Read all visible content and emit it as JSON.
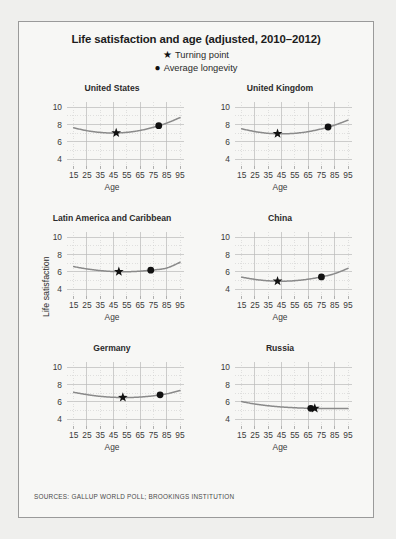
{
  "figure": {
    "title": "Life satisfaction and age (adjusted, 2010–2012)",
    "source": "SOURCES: GALLUP WORLD POLL; BROOKINGS INSTITUTION",
    "ylabel": "Life satisfaction",
    "xlabel": "Age",
    "legend": [
      {
        "marker": "★",
        "label": "Turning point",
        "name": "turning-point"
      },
      {
        "marker": "●",
        "label": "Average longevity",
        "name": "average-longevity"
      }
    ],
    "line_color": "#8a8a8a",
    "marker_color": "#111111",
    "grid_major_color": "#b9b9b9",
    "grid_minor_color": "#cfcfcf",
    "axis_color": "#8e8e8e",
    "panel_bg": "#f7f7f5",
    "border_color": "#9a9a9a"
  },
  "chart_data": {
    "type": "line",
    "title": "Life satisfaction and age (adjusted, 2010–2012)",
    "xlabel": "Age",
    "ylabel": "Life satisfaction",
    "xlim": [
      10,
      98
    ],
    "ylim": [
      3.2,
      10.6
    ],
    "xticks": [
      15,
      25,
      35,
      45,
      55,
      65,
      75,
      85,
      95
    ],
    "yticks": [
      4,
      6,
      8,
      10
    ],
    "yticks_minor": [
      5,
      7,
      9
    ],
    "grid": true,
    "legend_position": "top-center",
    "panels": [
      {
        "name": "united-states",
        "title": "United States",
        "x": [
          15,
          25,
          35,
          45,
          55,
          65,
          75,
          85,
          95
        ],
        "y": [
          7.62,
          7.28,
          7.08,
          7.01,
          7.09,
          7.31,
          7.67,
          8.16,
          8.8
        ],
        "turning_point": {
          "age": 47,
          "value": 7.01
        },
        "average_longevity": {
          "age": 79,
          "value": 7.84
        }
      },
      {
        "name": "united-kingdom",
        "title": "United Kingdom",
        "x": [
          15,
          25,
          35,
          45,
          55,
          65,
          75,
          85,
          95
        ],
        "y": [
          7.5,
          7.18,
          6.98,
          6.92,
          6.98,
          7.17,
          7.49,
          7.93,
          8.5
        ],
        "turning_point": {
          "age": 42,
          "value": 6.91
        },
        "average_longevity": {
          "age": 80,
          "value": 7.7
        }
      },
      {
        "name": "latin-america-and-caribbean",
        "title": "Latin America and Caribbean",
        "x": [
          15,
          25,
          35,
          45,
          55,
          65,
          75,
          85,
          95
        ],
        "y": [
          6.6,
          6.33,
          6.14,
          6.03,
          6.01,
          6.07,
          6.21,
          6.44,
          7.1
        ],
        "turning_point": {
          "age": 49,
          "value": 6.01
        },
        "average_longevity": {
          "age": 73,
          "value": 6.28
        }
      },
      {
        "name": "china",
        "title": "China",
        "x": [
          15,
          25,
          35,
          45,
          55,
          65,
          75,
          85,
          95
        ],
        "y": [
          5.38,
          5.12,
          4.96,
          4.91,
          4.97,
          5.14,
          5.41,
          5.79,
          6.4
        ],
        "turning_point": {
          "age": 42,
          "value": 4.9
        },
        "average_longevity": {
          "age": 75,
          "value": 5.58
        }
      },
      {
        "name": "germany",
        "title": "Germany",
        "x": [
          15,
          25,
          35,
          45,
          55,
          65,
          75,
          85,
          95
        ],
        "y": [
          7.1,
          6.83,
          6.63,
          6.52,
          6.49,
          6.55,
          6.69,
          6.92,
          7.3
        ],
        "turning_point": {
          "age": 52,
          "value": 6.49
        },
        "average_longevity": {
          "age": 80,
          "value": 6.88
        }
      },
      {
        "name": "russia",
        "title": "Russia",
        "x": [
          15,
          25,
          35,
          45,
          55,
          65,
          75,
          85,
          95
        ],
        "y": [
          6.02,
          5.74,
          5.54,
          5.4,
          5.31,
          5.25,
          5.22,
          5.21,
          5.22
        ],
        "turning_point": {
          "age": 70,
          "value": 5.23
        },
        "average_longevity": {
          "age": 67,
          "value": 5.24
        }
      }
    ]
  }
}
